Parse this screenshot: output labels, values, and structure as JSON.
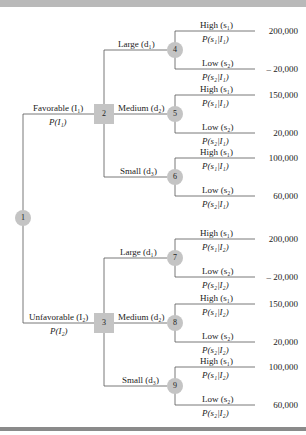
{
  "diagram": {
    "type": "decision-tree",
    "root": {
      "id": "1",
      "kind": "chance"
    },
    "indicators": [
      {
        "label": "Favorable",
        "symbol": "I",
        "sub": "1",
        "prob": "P(I₁)",
        "node": "2"
      },
      {
        "label": "Unfavorable",
        "symbol": "I",
        "sub": "2",
        "prob": "P(I₂)",
        "node": "3"
      }
    ],
    "decision_nodes": [
      {
        "id": "2",
        "kind": "decision",
        "branches": [
          {
            "label": "Large (d₁)",
            "node": "4"
          },
          {
            "label": "Medium (d₂)",
            "node": "5"
          },
          {
            "label": "Small (d₃)",
            "node": "6"
          }
        ]
      },
      {
        "id": "3",
        "kind": "decision",
        "branches": [
          {
            "label": "Large (d₁)",
            "node": "7"
          },
          {
            "label": "Medium (d₂)",
            "node": "8"
          },
          {
            "label": "Small (d₃)",
            "node": "9"
          }
        ]
      }
    ],
    "chance_nodes": [
      {
        "id": "4",
        "high": {
          "label": "High (s₁)",
          "prob": "P(s₁|I₁)",
          "payoff": "200,000"
        },
        "low": {
          "label": "Low (s₂)",
          "prob": "P(s₂|I₁)",
          "payoff": "– 20,000"
        }
      },
      {
        "id": "5",
        "high": {
          "label": "High (s₁)",
          "prob": "P(s₁|I₁)",
          "payoff": "150,000"
        },
        "low": {
          "label": "Low (s₂)",
          "prob": "P(s₂|I₁)",
          "payoff": "20,000"
        }
      },
      {
        "id": "6",
        "high": {
          "label": "High (s₁)",
          "prob": "P(s₁|I₁)",
          "payoff": "100,000"
        },
        "low": {
          "label": "Low (s₂)",
          "prob": "P(s₂|I₁)",
          "payoff": "60,000"
        }
      },
      {
        "id": "7",
        "high": {
          "label": "High (s₁)",
          "prob": "P(s₁|I₂)",
          "payoff": "200,000"
        },
        "low": {
          "label": "Low (s₂)",
          "prob": "P(s₂|I₂)",
          "payoff": "– 20,000"
        }
      },
      {
        "id": "8",
        "high": {
          "label": "High (s₁)",
          "prob": "P(s₁|I₂)",
          "payoff": "150,000"
        },
        "low": {
          "label": "Low (s₂)",
          "prob": "P(s₂|I₂)",
          "payoff": "20,000"
        }
      },
      {
        "id": "9",
        "high": {
          "label": "High (s₁)",
          "prob": "P(s₁|I₂)",
          "payoff": "100,000"
        },
        "low": {
          "label": "Low (s₂)",
          "prob": "P(s₂|I₂)",
          "payoff": "60,000"
        }
      }
    ]
  },
  "labels": {
    "fav": "Favorable (I₁)",
    "fav_p": "P(I₁)",
    "unfav": "Unfavorable (I₂)",
    "unfav_p": "P(I₂)"
  },
  "colors": {
    "node_fill": "#c4c4c4",
    "line": "#555555",
    "bar": "#b9b9b9"
  }
}
